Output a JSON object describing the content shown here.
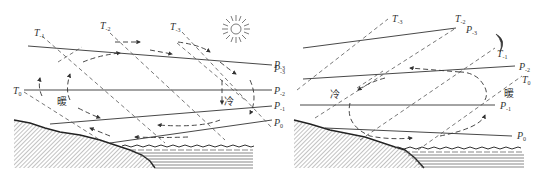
{
  "figure": {
    "left_panel": {
      "name": "daytime sea breeze",
      "warm_label": "暖",
      "cold_label": "冷",
      "sun_icon": "sun-icon",
      "isotherm_labels": [
        {
          "base": "T",
          "sub": "-1"
        },
        {
          "base": "T",
          "sub": "-2"
        },
        {
          "base": "T",
          "sub": "-3"
        },
        {
          "base": "T",
          "sub": "0"
        }
      ],
      "isobar_labels": [
        {
          "base": "P",
          "sub": "-3"
        },
        {
          "base": "P",
          "sub": "-2"
        },
        {
          "base": "P",
          "sub": "-1"
        },
        {
          "base": "P",
          "sub": "0"
        }
      ]
    },
    "right_panel": {
      "name": "nighttime land breeze",
      "warm_label": "暖",
      "cold_label": "冷",
      "moon_icon": "moon-icon",
      "isotherm_labels": [
        {
          "base": "T",
          "sub": "-3"
        },
        {
          "base": "T",
          "sub": "-2"
        },
        {
          "base": "T",
          "sub": "-1"
        },
        {
          "base": "T",
          "sub": "0"
        }
      ],
      "isobar_labels_left": [
        {
          "base": "P",
          "sub": "-3"
        },
        {
          "base": "P",
          "sub": "-2"
        },
        {
          "base": "P",
          "sub": "-1"
        },
        {
          "base": "P",
          "sub": "0"
        }
      ],
      "isobar_labels_right": [
        {
          "base": "P",
          "sub": "-3"
        },
        {
          "base": "P",
          "sub": "-2"
        },
        {
          "base": "P",
          "sub": "-1"
        },
        {
          "base": "P",
          "sub": "0"
        }
      ]
    },
    "colors": {
      "line": "#333333",
      "dash": "#555555",
      "hatch": "#666666",
      "background": "#ffffff"
    }
  }
}
